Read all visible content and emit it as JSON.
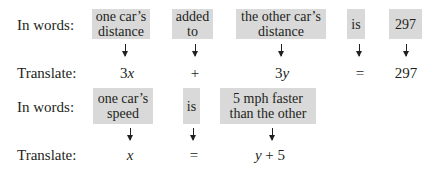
{
  "rows": [
    {
      "words_label": "In words:",
      "translate_label": "Translate:",
      "items": [
        {
          "phrase": "one car’s\ndistance",
          "symbol": "3x"
        },
        {
          "phrase": "added\nto",
          "symbol": "+"
        },
        {
          "phrase": "the other car’s\ndistance",
          "symbol": "3y"
        },
        {
          "phrase": "is",
          "symbol": "="
        },
        {
          "phrase": "297",
          "symbol": "297"
        }
      ]
    },
    {
      "words_label": "In words:",
      "translate_label": "Translate:",
      "items": [
        {
          "phrase": "one car’s\nspeed",
          "symbol": "x"
        },
        {
          "phrase": "is",
          "symbol": "="
        },
        {
          "phrase": "5 mph faster\nthan the other",
          "symbol": "y + 5"
        }
      ]
    }
  ],
  "colors": {
    "box_fill": "#d9d9d9",
    "text": "#231f20"
  }
}
